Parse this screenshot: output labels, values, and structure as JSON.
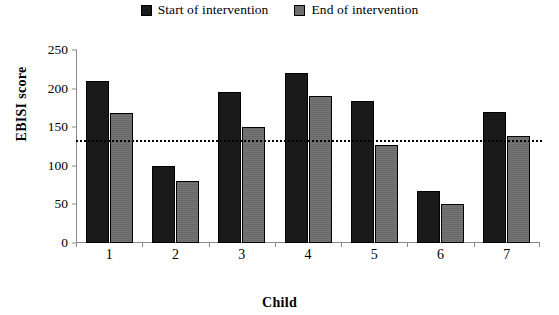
{
  "chart_data": {
    "type": "bar",
    "title": "",
    "xlabel": "Child",
    "ylabel": "EBISI score",
    "categories": [
      "1",
      "2",
      "3",
      "4",
      "5",
      "6",
      "7"
    ],
    "series": [
      {
        "name": "Start of intervention",
        "color": "#1a1a1a",
        "values": [
          210,
          100,
          196,
          220,
          184,
          68,
          170
        ]
      },
      {
        "name": "End of intervention",
        "color": "#6e6e6e",
        "values": [
          168,
          80,
          150,
          190,
          127,
          50,
          139
        ]
      }
    ],
    "ylim": [
      0,
      250
    ],
    "yticks": [
      0,
      50,
      100,
      150,
      200,
      250
    ],
    "grid": false,
    "legend_position": "top-center",
    "annotations": [
      {
        "name": "reference-line",
        "type": "horizontal-line",
        "value": 133,
        "style": "dotted",
        "color": "#000000"
      }
    ]
  },
  "legend": {
    "items": [
      {
        "label": "Start of intervention",
        "swatch": "legend-swatch-start",
        "color": "#1a1a1a"
      },
      {
        "label": "End of intervention",
        "swatch": "legend-swatch-end",
        "color": "#6e6e6e"
      }
    ]
  },
  "axes": {
    "y_title": "EBISI score",
    "x_title": "Child",
    "y_tick_labels": [
      "250",
      "200",
      "150",
      "100",
      "50",
      "0"
    ],
    "x_tick_labels": [
      "1",
      "2",
      "3",
      "4",
      "5",
      "6",
      "7"
    ]
  }
}
